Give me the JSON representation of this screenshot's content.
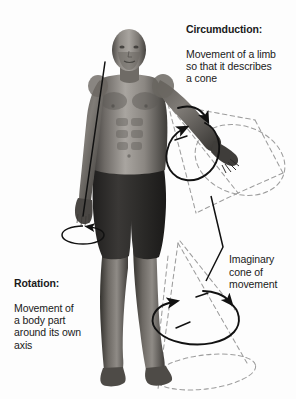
{
  "image": {
    "title": "Circumduction and rotation of limbs",
    "background_color": "#fdfdfd",
    "width": 296,
    "height": 399
  },
  "subject": {
    "name": "anatomical-male-figure",
    "description": "Grayscale rendered male human figure, bald, standing facing forward, wearing dark shorts, right arm raised laterally and extended",
    "skin_tone_light": "#b9b5b0",
    "skin_tone_mid": "#817d78",
    "skin_tone_dark": "#4a4744",
    "shorts_color": "#2b2a29"
  },
  "annotations": {
    "circumduction": {
      "heading": "Circumduction:",
      "body": "Movement of a limb\nso that it describes\na cone",
      "color": "#1a1a1a"
    },
    "rotation": {
      "heading": "Rotation:",
      "body": "Movement of\na body part\naround its own\naxis",
      "color": "#1a1a1a"
    },
    "imaginary_cone": {
      "heading": "",
      "body": "Imaginary\ncone of\nmovement",
      "color": "#1a1a1a"
    }
  },
  "graphics": {
    "arm_cone": {
      "name": "dashed-cone-arm",
      "style": "dashed",
      "color": "#9a9a9a",
      "apex": "right shoulder",
      "base": "large dashed ellipse to the right of the hand"
    },
    "leg_cone": {
      "name": "dashed-cone-leg",
      "style": "dashed",
      "color": "#9a9a9a",
      "apex": "right hip",
      "base": "dashed ellipse below the right foot"
    },
    "arm_circle_arrow": {
      "name": "circumduction-arrow-arm",
      "color": "#111111",
      "description": "Solid black elliptical arrow encircling the extended arm indicating circular sweep"
    },
    "leg_circle_arrow": {
      "name": "circumduction-arrow-leg",
      "color": "#111111",
      "description": "Solid black elliptical arrow encircling the lower leg indicating circular sweep"
    },
    "rotation_axis_line": {
      "name": "rotation-axis-line",
      "color": "#111111",
      "description": "Thin straight black line along the left arm marking its own long axis"
    },
    "hand_rotation_ellipse": {
      "name": "rotation-arrow-hand",
      "color": "#111111",
      "description": "Small black ellipse with arrowhead beneath the left hand showing rotation about the axis"
    },
    "cone_leader": {
      "name": "imaginary-cone-leader-line",
      "color": "#111111",
      "description": "Solid black V-shaped leader line linking the caption to the cone"
    }
  }
}
